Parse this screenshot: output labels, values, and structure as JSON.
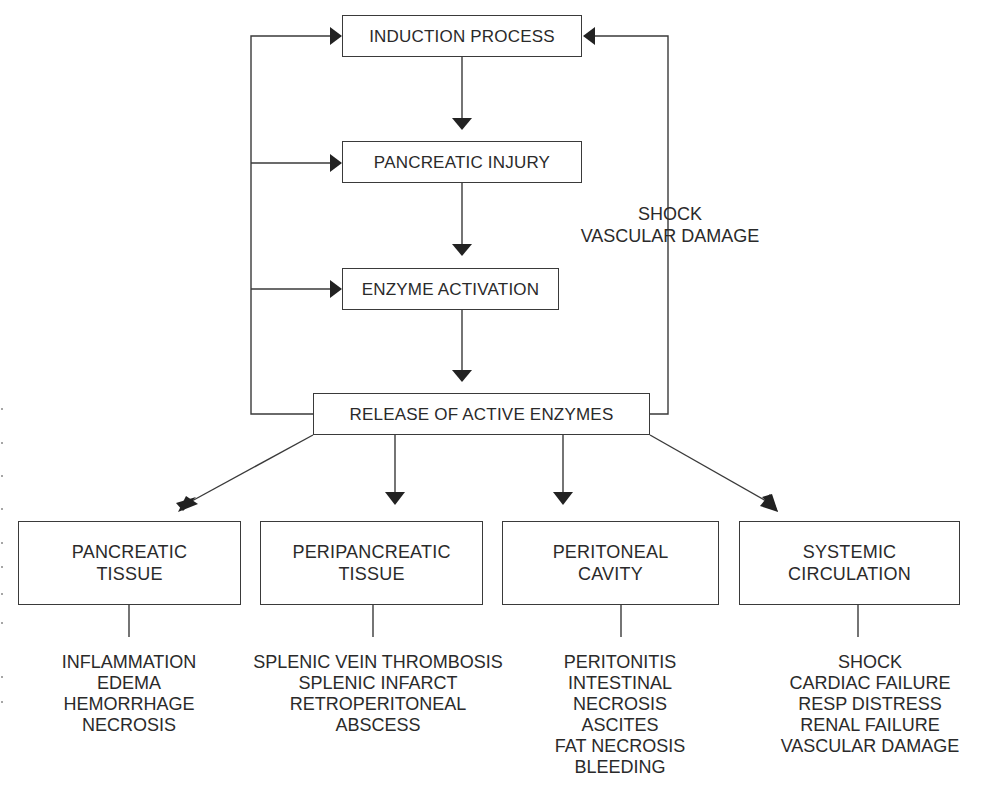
{
  "diagram": {
    "stages": [
      {
        "id": "induction",
        "label": "INDUCTION PROCESS"
      },
      {
        "id": "injury",
        "label": "PANCREATIC INJURY"
      },
      {
        "id": "activation",
        "label": "ENZYME ACTIVATION"
      },
      {
        "id": "release",
        "label": "RELEASE OF ACTIVE ENZYMES"
      }
    ],
    "feedback_label": {
      "line1": "SHOCK",
      "line2": "VASCULAR DAMAGE"
    },
    "targets": [
      {
        "title": [
          "PANCREATIC",
          "TISSUE"
        ],
        "effects": [
          "INFLAMMATION",
          "EDEMA",
          "HEMORRHAGE",
          "NECROSIS"
        ]
      },
      {
        "title": [
          "PERIPANCREATIC",
          "TISSUE"
        ],
        "effects": [
          "SPLENIC VEIN THROMBOSIS",
          "SPLENIC INFARCT",
          "RETROPERITONEAL",
          "ABSCESS"
        ]
      },
      {
        "title": [
          "PERITONEAL",
          "CAVITY"
        ],
        "effects": [
          "PERITONITIS",
          "INTESTINAL",
          "NECROSIS",
          "ASCITES",
          "FAT NECROSIS",
          "BLEEDING"
        ]
      },
      {
        "title": [
          "SYSTEMIC",
          "CIRCULATION"
        ],
        "effects": [
          "SHOCK",
          "CARDIAC FAILURE",
          "RESP DISTRESS",
          "RENAL FAILURE",
          "VASCULAR DAMAGE"
        ]
      }
    ],
    "colors": {
      "line": "#3a3a3a",
      "background": "#ffffff",
      "text": "#2a2a2a"
    }
  }
}
